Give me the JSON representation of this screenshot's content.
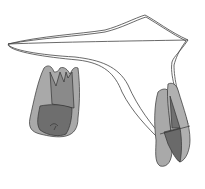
{
  "figure": {
    "background": "#ffffff",
    "stroke_color": "#333333",
    "light_fill": "#a8a8a8",
    "mid_fill": "#8c8c8c",
    "dark_fill": "#6a6a6a",
    "elements": [
      {
        "name": "outline-curve",
        "description": "Thin double-line outline spanning top from left to right, curving down to right tooth"
      },
      {
        "name": "left-tooth",
        "description": "Molar with three cusps/roots pointing up, shaded gray"
      },
      {
        "name": "right-tooth",
        "description": "Elongated tooth viewed from side, shaded gray"
      }
    ]
  }
}
